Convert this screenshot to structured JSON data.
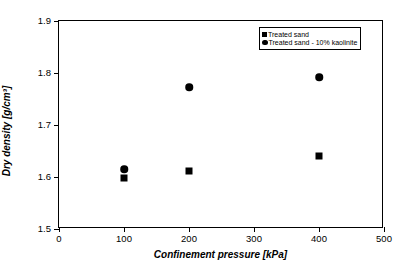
{
  "chart_data": {
    "type": "scatter",
    "title": "",
    "xlabel": "Confinement pressure [kPa]",
    "ylabel": "Dry density [g/cm³]",
    "xlim": [
      0,
      500
    ],
    "ylim": [
      1.5,
      1.9
    ],
    "xticks": [
      0,
      100,
      200,
      300,
      400,
      500
    ],
    "yticks": [
      1.5,
      1.6,
      1.7,
      1.8,
      1.9
    ],
    "xtick_labels": [
      "0",
      "100",
      "200",
      "300",
      "400",
      "500"
    ],
    "ytick_labels": [
      "1.5",
      "1.6",
      "1.7",
      "1.8",
      "1.9"
    ],
    "grid": false,
    "legend_position": "top-right",
    "series": [
      {
        "name": "Treated sand",
        "marker": "square",
        "color": "#000000",
        "points": [
          {
            "x": 100,
            "y": 1.598
          },
          {
            "x": 200,
            "y": 1.611
          },
          {
            "x": 400,
            "y": 1.64
          }
        ]
      },
      {
        "name": "Treated sand - 10% kaolinite",
        "marker": "circle",
        "color": "#000000",
        "points": [
          {
            "x": 100,
            "y": 1.615
          },
          {
            "x": 200,
            "y": 1.773
          },
          {
            "x": 400,
            "y": 1.792
          }
        ]
      }
    ]
  }
}
